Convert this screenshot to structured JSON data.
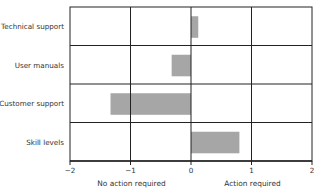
{
  "chart_data": {
    "type": "bar",
    "orientation": "horizontal",
    "title": "",
    "xlabel": "",
    "ylabel": "",
    "categories": [
      "Technical support",
      "User manuals",
      "Customer support",
      "Skill levels"
    ],
    "values": [
      0.12,
      -0.32,
      -1.33,
      0.8
    ],
    "xlim": [
      -2,
      2
    ],
    "xticks": [
      "−2",
      "−1",
      "0",
      "1",
      "2"
    ],
    "xtick_values": [
      -2,
      -1,
      0,
      1,
      2
    ],
    "annotations": [
      {
        "text": "No action required",
        "x": -1
      },
      {
        "text": "Action required",
        "x": 1
      }
    ],
    "grid": true,
    "legend": null,
    "bar_color": "#a6a6a6",
    "grid_color": "#222222"
  }
}
